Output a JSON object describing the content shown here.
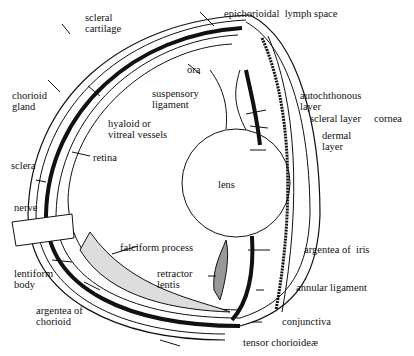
{
  "diagram": {
    "labels": {
      "scleral_cartilage": "scleral\ncartilage",
      "epichorioidal_lymph_space": "epichorioidal  lymph space",
      "ora": "ora",
      "suspensory_ligament": "suspensory\nligament",
      "chorioid_gland": "chorioid\ngland",
      "hyaloid_vessels": "hyaloid or\nvitreal vessels",
      "autochthonous_layer": "autochthonous\nlayer",
      "scleral_layer": "scleral layer",
      "dermal_layer": "dermal\nlayer",
      "cornea": "cornea",
      "sclera": "sclera",
      "retina": "retina",
      "lens": "lens",
      "nerve": "nerve",
      "falciform_process": "falciform process",
      "argentea_of_iris": "argentea of  iris",
      "lentiform_body": "lentiform\nbody",
      "retractor_lentis": "retractor\nlentis",
      "annular_ligament": "annular ligament",
      "argentea_of_chorioid": "argentea of\nchorioid",
      "conjunctiva": "conjunctiva",
      "tensor_chorioideae": "tensor chorioideæ"
    },
    "colors": {
      "ink": "#111111",
      "background": "#ffffff"
    }
  }
}
